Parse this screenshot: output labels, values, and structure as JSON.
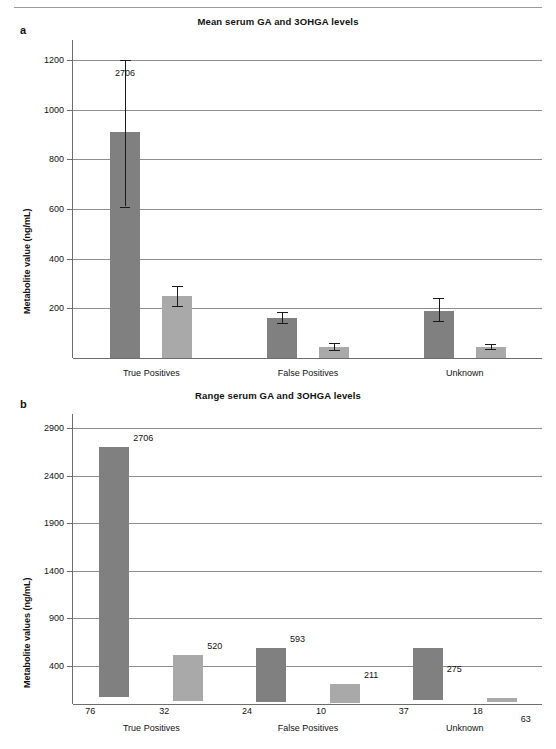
{
  "figure": {
    "top_cut_text": "",
    "panels": [
      {
        "letter": "a",
        "title": "Mean serum GA and 3OHGA levels"
      },
      {
        "letter": "b",
        "title": "Range serum GA and 3OHGA levels"
      }
    ]
  },
  "colors": {
    "dark_series": "#808080",
    "light_series": "#a9a9a9",
    "gridline": "#8e8e8e",
    "axis": "#6d6d6d",
    "error_bar": "#1a1a1a",
    "text": "#111111"
  },
  "chart_data": [
    {
      "type": "bar",
      "panel": "a",
      "title": "Mean serum GA and 3OHGA levels",
      "xlabel": "",
      "ylabel": "Metabolite value (ng/mL)",
      "ylim": [
        0,
        1280
      ],
      "yticks": [
        200,
        400,
        600,
        800,
        1000,
        1200
      ],
      "ytick_labels": [
        "200",
        "400",
        "600",
        "800",
        "1000",
        "1200"
      ],
      "grid": true,
      "legend": "none",
      "categories": [
        "True Positives",
        "False Positives",
        "Unknown"
      ],
      "series": [
        {
          "name": "GA",
          "color": "#808080",
          "values": [
            910,
            162,
            188
          ],
          "error_low": [
            610,
            140,
            150
          ],
          "error_high": [
            1200,
            186,
            240
          ]
        },
        {
          "name": "3OHGA",
          "color": "#a9a9a9",
          "values": [
            248,
            45,
            45
          ],
          "error_low": [
            208,
            34,
            36
          ],
          "error_high": [
            290,
            60,
            58
          ]
        }
      ],
      "annotations": [
        {
          "text": "2706",
          "series": "GA",
          "category": "True Positives",
          "note": "error bar upper limit clipped at axis top"
        }
      ]
    },
    {
      "type": "bar",
      "panel": "b",
      "title": "Range serum GA and 3OHGA levels",
      "xlabel": "",
      "ylabel": "Metabolite values (ng/mL)",
      "ylim": [
        0,
        3050
      ],
      "yticks": [
        400,
        900,
        1400,
        1900,
        2400,
        2900
      ],
      "ytick_labels": [
        "400",
        "900",
        "1400",
        "1900",
        "2400",
        "2900"
      ],
      "grid": true,
      "legend": "none",
      "bar_style": "floating range bars (min to max)",
      "categories": [
        "True Positives",
        "False Positives",
        "Unknown"
      ],
      "series": [
        {
          "name": "GA",
          "color": "#808080",
          "min_values": [
            76,
            24,
            37
          ],
          "max_values": [
            2706,
            593,
            275
          ],
          "min_labels": [
            "76",
            "24",
            "37"
          ],
          "max_labels": [
            "2706",
            "593",
            "275"
          ]
        },
        {
          "name": "3OHGA",
          "color": "#a9a9a9",
          "min_values": [
            32,
            10,
            18
          ],
          "max_values": [
            520,
            211,
            63
          ],
          "min_labels": [
            "32",
            "10",
            "18"
          ],
          "max_labels": [
            "520",
            "211",
            "63"
          ]
        }
      ]
    }
  ]
}
